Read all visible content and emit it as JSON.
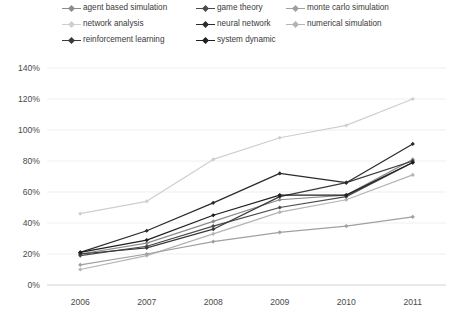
{
  "chart_data": {
    "type": "line",
    "title": "",
    "subtitle": "",
    "xlabel": "",
    "ylabel": "",
    "categories": [
      "2006",
      "2007",
      "2008",
      "2009",
      "2010",
      "2011"
    ],
    "x": [
      2006,
      2007,
      2008,
      2009,
      2010,
      2011
    ],
    "ylim": [
      0,
      140
    ],
    "ytick_labels": [
      "0%",
      "20%",
      "40%",
      "60%",
      "80%",
      "100%",
      "120%",
      "140%"
    ],
    "ytick_values": [
      0,
      20,
      40,
      60,
      80,
      100,
      120,
      140
    ],
    "grid": true,
    "grid_axis": "y",
    "legend_position": "top",
    "value_suffix": "%",
    "series": [
      {
        "name": "agent based simulation",
        "color": "#8c8c8c",
        "values": [
          20,
          27,
          41,
          55,
          58,
          81
        ]
      },
      {
        "name": "game theory",
        "color": "#4a4a4a",
        "values": [
          19,
          25,
          38,
          50,
          57,
          79
        ]
      },
      {
        "name": "monte carlo simulation",
        "color": "#a0a0a0",
        "values": [
          13,
          20,
          28,
          34,
          38,
          44
        ]
      },
      {
        "name": "network analysis",
        "color": "#cfcfcf",
        "values": [
          46,
          54,
          81,
          95,
          103,
          120
        ]
      },
      {
        "name": "neural network",
        "color": "#2b2b2b",
        "values": [
          21,
          35,
          53,
          72,
          66,
          91
        ]
      },
      {
        "name": "numerical simulation",
        "color": "#b4b4b4",
        "values": [
          10,
          19,
          33,
          47,
          55,
          71
        ]
      },
      {
        "name": "reinforcement learning",
        "color": "#3a3a3a",
        "values": [
          20,
          24,
          36,
          57,
          66,
          80
        ]
      },
      {
        "name": "system dynamic",
        "color": "#1f1f1f",
        "values": [
          21,
          29,
          45,
          58,
          58,
          79
        ]
      }
    ]
  },
  "legend": {
    "rows": [
      [
        "agent based simulation",
        "game theory",
        "monte carlo simulation"
      ],
      [
        "network analysis",
        "neural network",
        "numerical simulation"
      ],
      [
        "reinforcement learning",
        "system dynamic"
      ]
    ]
  }
}
